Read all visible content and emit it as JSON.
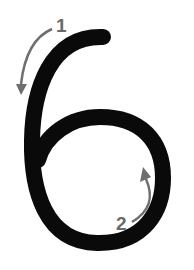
{
  "diagram": {
    "glyph": "6",
    "stroke_color": "#0a0a0a",
    "arrow_color": "#6e6e6e",
    "steps": [
      {
        "number": "1",
        "direction": "down-left arc"
      },
      {
        "number": "2",
        "direction": "up arc inside loop"
      }
    ]
  }
}
